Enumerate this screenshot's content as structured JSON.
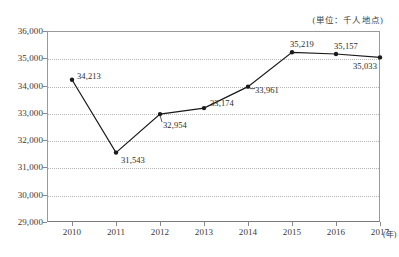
{
  "chart_data": {
    "type": "line",
    "title": "",
    "unit_caption": "(単位：千人地点)",
    "xlabel": "(年)",
    "ylabel": "",
    "categories": [
      "2010",
      "2011",
      "2012",
      "2013",
      "2014",
      "2015",
      "2016",
      "2017"
    ],
    "values": [
      34213,
      31543,
      32954,
      33174,
      33961,
      35219,
      35157,
      35033
    ],
    "point_labels": [
      "34,213",
      "31,543",
      "32,954",
      "33,174",
      "33,961",
      "35,219",
      "35,157",
      "35,033"
    ],
    "ylim": [
      29000,
      36000
    ],
    "ytick_values": [
      36000,
      35000,
      34000,
      33000,
      32000,
      31000,
      30000,
      29000
    ],
    "ytick_labels": [
      "36,000",
      "35,000",
      "34,000",
      "33,000",
      "32,000",
      "31,000",
      "30,000",
      "29,000"
    ],
    "grid": true,
    "grid_style": "dotted-horizontal",
    "legend": "none",
    "series": [
      {
        "name": "value",
        "values": [
          34213,
          31543,
          32954,
          33174,
          33961,
          35219,
          35157,
          35033
        ]
      }
    ],
    "marker": "filled-circle",
    "line_color": "#1a1a1a",
    "grid_color": "#b6b6b6",
    "axis_color": "#8a8a8a",
    "label_placement": [
      "right",
      "right",
      "below-leader",
      "right",
      "right-leader",
      "above",
      "above",
      "below"
    ]
  }
}
